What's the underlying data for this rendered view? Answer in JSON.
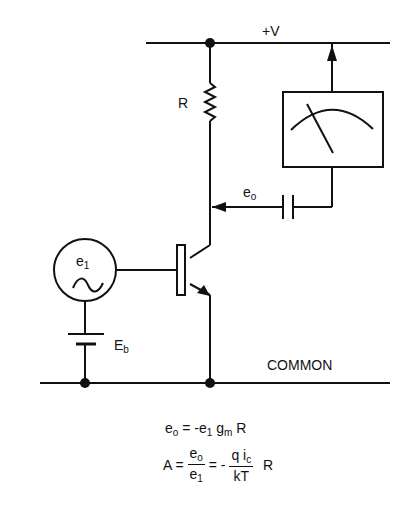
{
  "diagram": {
    "labels": {
      "supply": "+V",
      "resistor": "R",
      "output": "e",
      "output_sub": "o",
      "source": "e",
      "source_sub": "1",
      "bias": "E",
      "bias_sub": "b",
      "ground": "COMMON"
    },
    "components": [
      "supply rail +V",
      "collector resistor R",
      "NPN transistor",
      "AC source e1",
      "bias battery Eb",
      "coupling capacitor",
      "AC voltmeter",
      "common rail"
    ],
    "equations": {
      "eq1": {
        "lhs": "e",
        "lhs_sub": "o",
        "rhs_a": "= -e",
        "rhs_a_sub": "1",
        "rhs_b": " g",
        "rhs_b_sub": "m",
        "rhs_c": " R"
      },
      "eq2": {
        "lhs": "A =",
        "frac1_num": "e",
        "frac1_num_sub": "o",
        "frac1_den": "e",
        "frac1_den_sub": "1",
        "mid": "= -",
        "frac2_num_a": "q i",
        "frac2_num_sub": "c",
        "frac2_den": "kT",
        "tail": "R"
      }
    }
  }
}
